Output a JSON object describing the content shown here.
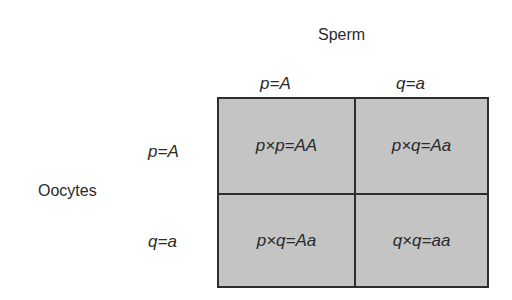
{
  "diagram": {
    "type": "punnett-square",
    "title_top": "Sperm",
    "title_left": "Oocytes",
    "columns": [
      {
        "label": "p=A"
      },
      {
        "label": "q=a"
      }
    ],
    "rows": [
      {
        "label": "p=A"
      },
      {
        "label": "q=a"
      }
    ],
    "cells": [
      [
        "p×p=AA",
        "p×q=Aa"
      ],
      [
        "p×q=Aa",
        "q×q=aa"
      ]
    ],
    "colors": {
      "cell_fill": "#c4c4c4",
      "border": "#2e2e2e",
      "text": "#2a2a2a",
      "background": "#ffffff"
    }
  }
}
